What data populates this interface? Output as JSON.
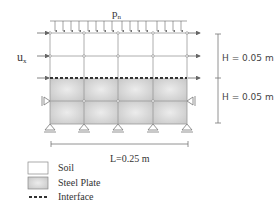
{
  "diagram": {
    "load_label": "p",
    "load_subscript": "n",
    "displacement_label": "u",
    "displacement_subscript": "x",
    "dimensions": {
      "height_top": "H = 0.05 m",
      "height_bottom": "H = 0.05 m",
      "length": "L=0.25 m"
    },
    "grid": {
      "columns": 4,
      "soil_rows": 2,
      "plate_rows": 2
    },
    "colors": {
      "soil": "#ffffff",
      "steel_plate": "#d9d9d9",
      "grid_line": "#999999",
      "interface": "#333333"
    }
  },
  "legend": {
    "items": [
      {
        "label": "Soil",
        "swatch": "soil"
      },
      {
        "label": "Steel Plate",
        "swatch": "steel"
      },
      {
        "label": "Interface",
        "swatch": "interface"
      }
    ]
  }
}
